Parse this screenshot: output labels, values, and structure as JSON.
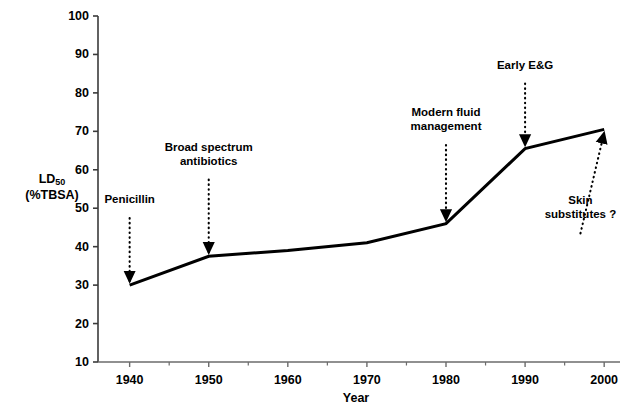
{
  "chart_data": {
    "type": "line",
    "title": "",
    "xlabel": "Year",
    "ylabel_line1": "LD",
    "ylabel_sub": "50",
    "ylabel_line2": "(%TBSA)",
    "x": [
      1940,
      1950,
      1960,
      1970,
      1980,
      1990,
      2000
    ],
    "values": [
      30,
      37.5,
      39,
      41,
      46,
      65.5,
      70.5
    ],
    "series": [
      {
        "name": "LD50 (%TBSA)",
        "values": [
          30,
          37.5,
          39,
          41,
          46,
          65.5,
          70.5
        ]
      }
    ],
    "xlim": [
      1936,
      2002
    ],
    "ylim": [
      10,
      100
    ],
    "xticks": [
      1940,
      1950,
      1960,
      1970,
      1980,
      1990,
      2000
    ],
    "xtick_labels": [
      "1940",
      "1950",
      "1960",
      "1970",
      "1980",
      "1990",
      "2000"
    ],
    "x_minor_tick_interval": 5,
    "yticks": [
      10,
      20,
      30,
      40,
      50,
      60,
      70,
      80,
      90,
      100
    ],
    "ytick_labels": [
      "10",
      "20",
      "30",
      "40",
      "50",
      "60",
      "70",
      "80",
      "90",
      "100"
    ],
    "grid": false,
    "legend": "none",
    "line_color": "#000000",
    "line_width": 3,
    "annotations": [
      {
        "id": "penicillin",
        "lines": [
          "Penicillin"
        ],
        "target_x": 1940,
        "target_y": 30,
        "label_x": 1940,
        "label_y": 49
      },
      {
        "id": "broad-spectrum-antibiotics",
        "lines": [
          "Broad spectrum",
          "antibiotics"
        ],
        "target_x": 1950,
        "target_y": 37.5,
        "label_x": 1950,
        "label_y": 59
      },
      {
        "id": "modern-fluid-management",
        "lines": [
          "Modern fluid",
          "management"
        ],
        "target_x": 1980,
        "target_y": 46,
        "label_x": 1980,
        "label_y": 68
      },
      {
        "id": "early-eg",
        "lines": [
          "Early E&G"
        ],
        "target_x": 1990,
        "target_y": 65.5,
        "label_x": 1990,
        "label_y": 84
      },
      {
        "id": "skin-substitutes",
        "lines": [
          "Skin",
          "substitutes ?"
        ],
        "target_x": 2000,
        "target_y": 70.5,
        "label_x": 1997,
        "label_y": 45
      }
    ]
  }
}
